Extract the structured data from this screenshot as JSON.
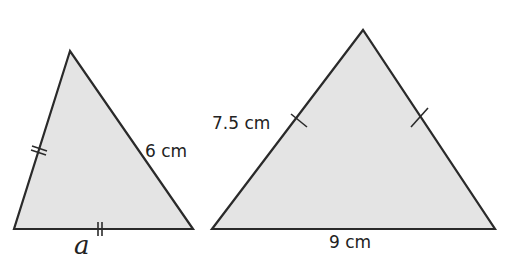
{
  "diagram": {
    "fill_color": "#e4e4e4",
    "stroke_color": "#2a2a2a",
    "left_triangle": {
      "side_right_label": "6 cm",
      "base_label": "a",
      "equal_side_marks": "double tick on left side and base"
    },
    "right_triangle": {
      "side_left_label": "7.5 cm",
      "base_label": "9 cm",
      "equal_side_marks": "single tick on left and right sides"
    }
  }
}
